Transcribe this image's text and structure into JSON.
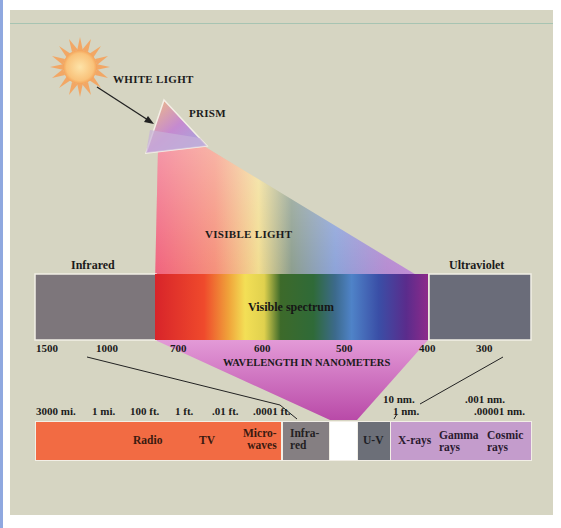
{
  "labels": {
    "white_light": "WHITE LIGHT",
    "prism": "PRISM",
    "visible_light": "VISIBLE LIGHT",
    "infrared": "Infrared",
    "ultraviolet": "Ultraviolet",
    "visible_spectrum": "Visible spectrum",
    "wavelength_nm": "WAVELENGTH IN NANOMETERS"
  },
  "nm_ticks": [
    "1500",
    "1000",
    "700",
    "600",
    "500",
    "400",
    "300"
  ],
  "length_ticks": [
    "3000 mi.",
    "1 mi.",
    "100 ft.",
    "1 ft.",
    ".01 ft.",
    ".0001 ft."
  ],
  "nm_small_ticks": {
    "ten_nm": "10 nm.",
    "one_nm": "1 nm.",
    "thousandth_nm": ".001 nm.",
    "hundred_thousandth_nm": ".00001 nm."
  },
  "bands": {
    "radio": "Radio",
    "tv": "TV",
    "micro_1": "Micro-",
    "micro_2": "waves",
    "infra_1": "Infra-",
    "infra_2": "red",
    "uv": "U-V",
    "xrays": "X-rays",
    "gamma_1": "Gamma",
    "gamma_2": "rays",
    "cosmic_1": "Cosmic",
    "cosmic_2": "rays"
  },
  "colors": {
    "background": "#d6d5c2",
    "infrared_block": "#7d767b",
    "ultraviolet_block": "#6a6c79",
    "radio_band": "#f26b43",
    "infrared_band": "#857f82",
    "uv_band": "#6c6f78",
    "xray_band": "#c49ccc",
    "wavelength_funnel": "#d579c6",
    "sun": "#f6a35c"
  }
}
